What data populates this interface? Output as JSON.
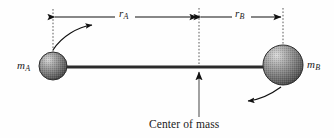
{
  "figure": {
    "background_color": "#fefefe",
    "ink_color": "#1a1a1a",
    "width": 334,
    "height": 138
  },
  "labels": {
    "mass_a": {
      "symbol": "m",
      "subscript": "A",
      "name": "mass-a-label"
    },
    "mass_b": {
      "symbol": "m",
      "subscript": "B",
      "name": "mass-b-label"
    },
    "distance_a": {
      "symbol": "r",
      "subscript": "A",
      "name": "distance-a-label"
    },
    "distance_b": {
      "symbol": "r",
      "subscript": "B",
      "name": "distance-b-label"
    },
    "center_of_mass": "Center of mass"
  },
  "geometry": {
    "sphere_a": {
      "cx": 53,
      "cy": 66,
      "r": 14
    },
    "sphere_b": {
      "cx": 283,
      "cy": 65,
      "r": 20
    },
    "rod": {
      "x1": 53,
      "x2": 283,
      "y": 67,
      "thickness": 3
    },
    "pivot_x": 199,
    "dimension_line_y": 17,
    "dashed_left_x": 53,
    "dashed_center_x": 199,
    "dashed_right_x": 283
  },
  "colors": {
    "sphere_dark": "#4a4a4a",
    "sphere_mid": "#8e8e8e",
    "sphere_light": "#d2d2d2",
    "rod": "#2b2b2b",
    "dashed": "#555555",
    "arrow": "#111111"
  },
  "annotations": {
    "rotation_arrow_a": "curved-arrow-counterclockwise-top-left",
    "rotation_arrow_b": "curved-arrow-counterclockwise-bottom-right",
    "pointer_arrow": "up-arrow-to-center-of-mass"
  }
}
